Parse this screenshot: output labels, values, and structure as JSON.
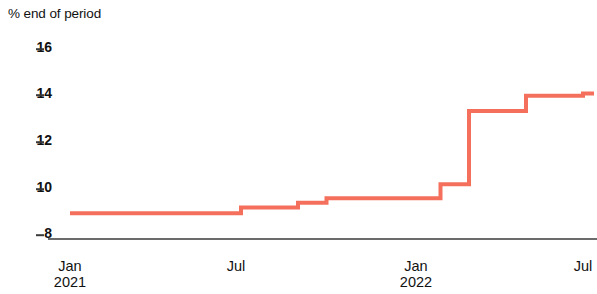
{
  "chart_data": {
    "type": "line",
    "title": "% end of period",
    "subtitle": "",
    "xlabel": "",
    "ylabel": "% end of period",
    "ylim": [
      8,
      16
    ],
    "xlim": [
      "2021-01",
      "2022-07"
    ],
    "grid": false,
    "legend": null,
    "line_style": "step-post",
    "yticks": [
      "16",
      "14",
      "12",
      "10",
      "8"
    ],
    "ytick_values": [
      16,
      14,
      12,
      10,
      8
    ],
    "xticks": [
      {
        "label": "Jan",
        "year": "2021"
      },
      {
        "label": "Jul",
        "year": ""
      },
      {
        "label": "Jan",
        "year": "2022"
      },
      {
        "label": "Jul",
        "year": ""
      }
    ],
    "xtick_x": [
      "2021-01",
      "2021-07",
      "2022-01",
      "2022-07"
    ],
    "colors": {
      "line": "#f5705c",
      "axis": "#3a3a3a",
      "text": "#111111"
    },
    "series": [
      {
        "name": "policy rate",
        "x": [
          "2021-01",
          "2021-02",
          "2021-03",
          "2021-04",
          "2021-05",
          "2021-06",
          "2021-07",
          "2021-08",
          "2021-09",
          "2021-10",
          "2021-11",
          "2021-12",
          "2022-01",
          "2022-02",
          "2022-03",
          "2022-04",
          "2022-05",
          "2022-06",
          "2022-07"
        ],
        "values": [
          8.85,
          8.85,
          8.85,
          8.85,
          8.85,
          8.85,
          9.1,
          9.1,
          9.3,
          9.5,
          9.5,
          9.5,
          9.5,
          10.1,
          13.25,
          13.25,
          13.9,
          13.9,
          14.0
        ]
      }
    ]
  }
}
